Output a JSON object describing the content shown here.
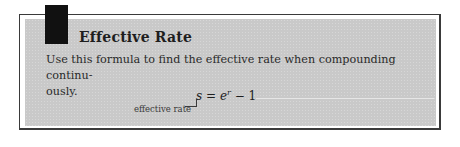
{
  "box": {
    "title": "Effective Rate",
    "body": "Use this formula to find the effective rate when compounding continu-ously.",
    "body_line1": "Use this formula to find the effective rate when compounding continu-",
    "body_line2": "ously.",
    "formula": {
      "lhs": "s",
      "equals": "=",
      "base": "e",
      "exponent": "r",
      "rest": "− 1"
    },
    "formula_label": "effective rate"
  },
  "colors": {
    "panel_fill": "#c9c9c9",
    "tab": "#111111",
    "border": "#3a3a3a"
  }
}
